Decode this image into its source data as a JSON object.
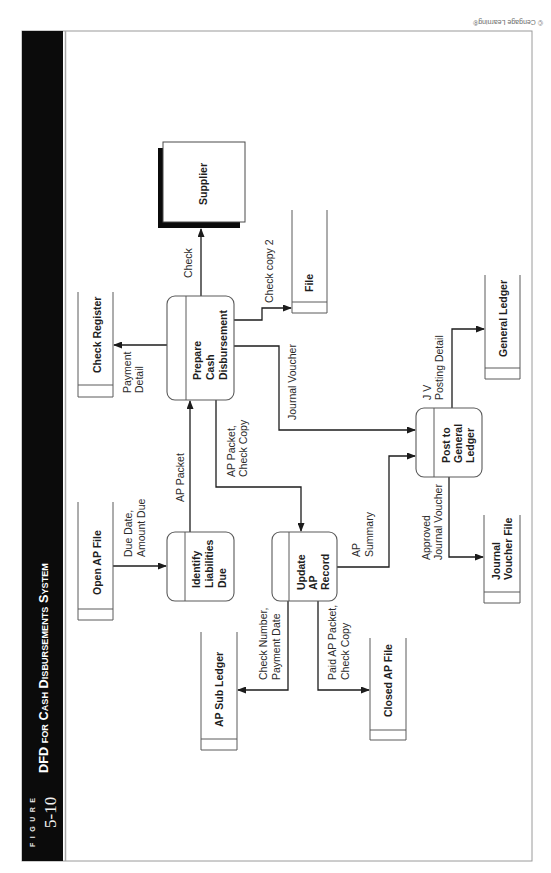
{
  "figure": {
    "label": "FIGURE",
    "number": "5-10",
    "title": "DFD for Cash Disbursements System"
  },
  "copyright": "© Cengage Learning®",
  "processes": [
    {
      "lines": [
        "Identify",
        "Liabilities",
        "Due"
      ]
    },
    {
      "lines": [
        "Prepare",
        "Cash",
        "Disbursement"
      ]
    },
    {
      "lines": [
        "Update",
        "AP",
        "Record"
      ]
    },
    {
      "lines": [
        "Post to",
        "General",
        "Ledger"
      ]
    }
  ],
  "data_stores": [
    {
      "lines": [
        "Open AP File"
      ]
    },
    {
      "lines": [
        "Check Register"
      ]
    },
    {
      "lines": [
        "File"
      ]
    },
    {
      "lines": [
        "General Ledger"
      ]
    },
    {
      "lines": [
        "Journal",
        "Voucher File"
      ]
    },
    {
      "lines": [
        "AP Sub Ledger"
      ]
    },
    {
      "lines": [
        "Closed AP File"
      ]
    }
  ],
  "external_entities": [
    {
      "label": "Supplier"
    }
  ],
  "data_flows": [
    {
      "from": "Open AP File",
      "to": "Identify Liabilities Due",
      "label": [
        "Due Date,",
        "Amount Due"
      ]
    },
    {
      "from": "Identify Liabilities Due",
      "to": "Prepare Cash Disbursement",
      "label": [
        "AP Packet"
      ]
    },
    {
      "from": "Prepare Cash Disbursement",
      "to": "Check Register",
      "label": [
        "Payment",
        "Detail"
      ]
    },
    {
      "from": "Prepare Cash Disbursement",
      "to": "Supplier",
      "label": [
        "Check"
      ]
    },
    {
      "from": "Prepare Cash Disbursement",
      "to": "File",
      "label": [
        "Check copy 2"
      ]
    },
    {
      "from": "Prepare Cash Disbursement",
      "to": "Post to General Ledger",
      "label": [
        "Journal Voucher"
      ]
    },
    {
      "from": "Prepare Cash Disbursement",
      "to": "Update AP Record",
      "label": [
        "AP Packet,",
        "Check Copy"
      ]
    },
    {
      "from": "Update AP Record",
      "to": "AP Sub Ledger",
      "label": [
        "Check Number,",
        "Payment Date"
      ]
    },
    {
      "from": "Update AP Record",
      "to": "Closed AP File",
      "label": [
        "Paid AP Packet,",
        "Check Copy"
      ]
    },
    {
      "from": "Update AP Record",
      "to": "Post to General Ledger",
      "label": [
        "AP",
        "Summary"
      ]
    },
    {
      "from": "Post to General Ledger",
      "to": "Journal Voucher File",
      "label": [
        "Approved",
        "Journal Voucher"
      ]
    },
    {
      "from": "Post to General Ledger",
      "to": "General Ledger",
      "label": [
        "J V",
        "Posting Detail"
      ]
    }
  ],
  "colors": {
    "band": "#0b0b0b",
    "flow_line": "#1c1c1c",
    "shape_outline": "#5a5a5a",
    "page_border": "#9a9a9a"
  }
}
